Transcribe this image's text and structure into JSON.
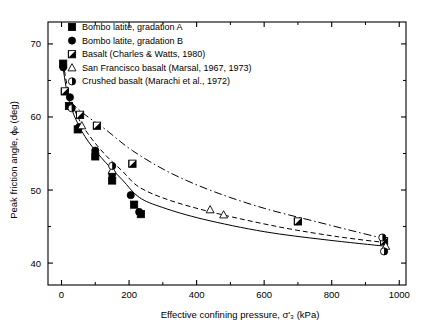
{
  "chart_data": {
    "type": "scatter",
    "title": "",
    "xlabel": "Effective confining pressure, σ'₃ (kPa)",
    "ylabel": "Peak friction angle, ϕₚ (deg)",
    "xlim": [
      -40,
      1020
    ],
    "ylim": [
      37,
      73
    ],
    "xticks": [
      0,
      200,
      400,
      600,
      800,
      1000
    ],
    "yticks": [
      40,
      50,
      60,
      70
    ],
    "grid": false,
    "legend_position": "top-center",
    "series": [
      {
        "name": "Bombo latite, gradation A",
        "marker": "filled-square",
        "points": [
          {
            "x": 5,
            "y": 67.3
          },
          {
            "x": 22,
            "y": 61.5
          },
          {
            "x": 48,
            "y": 58.3
          },
          {
            "x": 100,
            "y": 54.6
          },
          {
            "x": 150,
            "y": 51.3
          },
          {
            "x": 215,
            "y": 48.0
          },
          {
            "x": 235,
            "y": 46.7
          }
        ]
      },
      {
        "name": "Bombo latite, gradation B",
        "marker": "filled-circle",
        "points": [
          {
            "x": 5,
            "y": 66.8
          },
          {
            "x": 25,
            "y": 62.7
          },
          {
            "x": 52,
            "y": 58.6
          },
          {
            "x": 100,
            "y": 55.4
          },
          {
            "x": 150,
            "y": 52.2
          },
          {
            "x": 205,
            "y": 49.3
          },
          {
            "x": 230,
            "y": 47.0
          }
        ]
      },
      {
        "name": "Basalt (Charles & Watts, 1980)",
        "marker": "half-square",
        "points": [
          {
            "x": 10,
            "y": 63.5
          },
          {
            "x": 55,
            "y": 60.3
          },
          {
            "x": 105,
            "y": 58.8
          },
          {
            "x": 210,
            "y": 53.6
          },
          {
            "x": 700,
            "y": 45.7
          },
          {
            "x": 955,
            "y": 43.0
          }
        ]
      },
      {
        "name": "San Francisco basalt (Marsal, 1967, 1973)",
        "marker": "open-triangle",
        "points": [
          {
            "x": 60,
            "y": 58.8
          },
          {
            "x": 150,
            "y": 52.7
          },
          {
            "x": 440,
            "y": 47.3
          },
          {
            "x": 480,
            "y": 46.6
          },
          {
            "x": 960,
            "y": 42.3
          }
        ]
      },
      {
        "name": "Crushed basalt (Marachi et al., 1972)",
        "marker": "half-circle",
        "points": [
          {
            "x": 30,
            "y": 61.2
          },
          {
            "x": 150,
            "y": 53.3
          },
          {
            "x": 950,
            "y": 43.5
          },
          {
            "x": 955,
            "y": 41.6
          }
        ]
      }
    ],
    "curves": [
      {
        "name": "curve-gradation-A",
        "style": "solid",
        "points": [
          [
            5,
            66.6
          ],
          [
            20,
            62.6
          ],
          [
            45,
            59.4
          ],
          [
            80,
            56.6
          ],
          [
            130,
            53.8
          ],
          [
            180,
            51.4
          ],
          [
            230,
            49.0
          ],
          [
            300,
            47.6
          ],
          [
            420,
            46.0
          ],
          [
            600,
            44.3
          ],
          [
            780,
            43.2
          ],
          [
            960,
            42.3
          ]
        ]
      },
      {
        "name": "curve-gradation-B",
        "style": "dashed",
        "points": [
          [
            5,
            67.4
          ],
          [
            20,
            63.6
          ],
          [
            45,
            60.3
          ],
          [
            80,
            57.6
          ],
          [
            130,
            54.8
          ],
          [
            180,
            52.6
          ],
          [
            230,
            50.4
          ],
          [
            320,
            48.6
          ],
          [
            460,
            46.8
          ],
          [
            650,
            44.9
          ],
          [
            820,
            43.6
          ],
          [
            960,
            42.8
          ]
        ]
      },
      {
        "name": "curve-basalt-upper",
        "style": "dash-dot",
        "points": [
          [
            8,
            64.0
          ],
          [
            30,
            62.0
          ],
          [
            70,
            60.3
          ],
          [
            130,
            58.3
          ],
          [
            210,
            55.4
          ],
          [
            320,
            52.4
          ],
          [
            450,
            49.8
          ],
          [
            600,
            47.5
          ],
          [
            760,
            45.6
          ],
          [
            880,
            44.2
          ],
          [
            960,
            43.3
          ]
        ]
      }
    ]
  },
  "legend": {
    "items": [
      {
        "label": "Bombo latite, gradation A",
        "marker": "filled-square"
      },
      {
        "label": "Bombo latite, gradation B",
        "marker": "filled-circle"
      },
      {
        "label": "Basalt (Charles & Watts, 1980)",
        "marker": "half-square"
      },
      {
        "label": "San Francisco basalt (Marsal, 1967, 1973)",
        "marker": "open-triangle"
      },
      {
        "label": "Crushed basalt (Marachi et al., 1972)",
        "marker": "half-circle"
      }
    ]
  },
  "axes": {
    "x_label": "Effective confining pressure, σ'₃ (kPa)",
    "y_label": "Peak friction angle, ϕₚ (deg)",
    "x_ticks": [
      "0",
      "200",
      "400",
      "600",
      "800",
      "1000"
    ],
    "y_ticks": [
      "40",
      "50",
      "60",
      "70"
    ]
  },
  "colors": {
    "foreground": "#000000",
    "background": "#ffffff"
  }
}
